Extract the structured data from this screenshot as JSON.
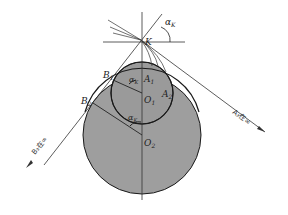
{
  "diagram": {
    "type": "geometry",
    "points": {
      "K": "K",
      "A1": "A",
      "A1_sub": "1",
      "A2": "A",
      "A2_sub": "2",
      "B1": "B",
      "B1_sub": "1",
      "B2": "B",
      "B2_sub": "2",
      "O1": "O",
      "O1_sub": "1",
      "O2": "O",
      "O2_sub": "2"
    },
    "angles": {
      "alpha": "α",
      "alpha_sub": "K"
    },
    "annotations": {
      "a3_label": "A₃在∞",
      "b3_label": "B₃在∞"
    },
    "colors": {
      "fill": "#9a9a9a",
      "stroke": "#1a1a1a",
      "background": "#ffffff"
    }
  }
}
